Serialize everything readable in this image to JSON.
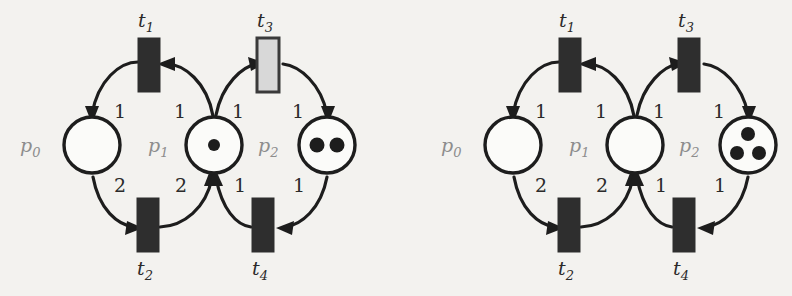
{
  "figure": {
    "kind": "petri-net-pair",
    "background_color": "#f3f2ef",
    "ink_color": "#1d1d1d",
    "place_label_color": "#8d8d8d",
    "enabled_transition_color": "#d8d8d8",
    "transition_color": "#2e2e2e"
  },
  "nets": [
    {
      "id": "left",
      "name": "petri-net-before-firing",
      "places": [
        {
          "id": "p0",
          "label": "p",
          "sub": "0",
          "tokens": 0
        },
        {
          "id": "p1",
          "label": "p",
          "sub": "1",
          "tokens": 1
        },
        {
          "id": "p2",
          "label": "p",
          "sub": "2",
          "tokens": 2
        }
      ],
      "transitions": [
        {
          "id": "t1",
          "label": "t",
          "sub": "1",
          "style": "dark"
        },
        {
          "id": "t2",
          "label": "t",
          "sub": "2",
          "style": "dark"
        },
        {
          "id": "t3",
          "label": "t",
          "sub": "3",
          "style": "light"
        },
        {
          "id": "t4",
          "label": "t",
          "sub": "4",
          "style": "dark"
        }
      ],
      "arcs": [
        {
          "from": "p1",
          "to": "t1",
          "weight": "1"
        },
        {
          "from": "t1",
          "to": "p0",
          "weight": "1"
        },
        {
          "from": "p0",
          "to": "t2",
          "weight": "2"
        },
        {
          "from": "t2",
          "to": "p1",
          "weight": "2"
        },
        {
          "from": "p1",
          "to": "t3",
          "weight": "1"
        },
        {
          "from": "t3",
          "to": "p2",
          "weight": "1"
        },
        {
          "from": "p2",
          "to": "t4",
          "weight": "1"
        },
        {
          "from": "t4",
          "to": "p1",
          "weight": "1"
        }
      ]
    },
    {
      "id": "right",
      "name": "petri-net-after-firing",
      "places": [
        {
          "id": "p0",
          "label": "p",
          "sub": "0",
          "tokens": 0
        },
        {
          "id": "p1",
          "label": "p",
          "sub": "1",
          "tokens": 0
        },
        {
          "id": "p2",
          "label": "p",
          "sub": "2",
          "tokens": 3
        }
      ],
      "transitions": [
        {
          "id": "t1",
          "label": "t",
          "sub": "1",
          "style": "dark"
        },
        {
          "id": "t2",
          "label": "t",
          "sub": "2",
          "style": "dark"
        },
        {
          "id": "t3",
          "label": "t",
          "sub": "3",
          "style": "dark"
        },
        {
          "id": "t4",
          "label": "t",
          "sub": "4",
          "style": "dark"
        }
      ],
      "arcs": [
        {
          "from": "p1",
          "to": "t1",
          "weight": "1"
        },
        {
          "from": "t1",
          "to": "p0",
          "weight": "1"
        },
        {
          "from": "p0",
          "to": "t2",
          "weight": "2"
        },
        {
          "from": "t2",
          "to": "p1",
          "weight": "2"
        },
        {
          "from": "p1",
          "to": "t3",
          "weight": "1"
        },
        {
          "from": "t3",
          "to": "p2",
          "weight": "1"
        },
        {
          "from": "p2",
          "to": "t4",
          "weight": "1"
        },
        {
          "from": "t4",
          "to": "p1",
          "weight": "1"
        }
      ]
    }
  ]
}
